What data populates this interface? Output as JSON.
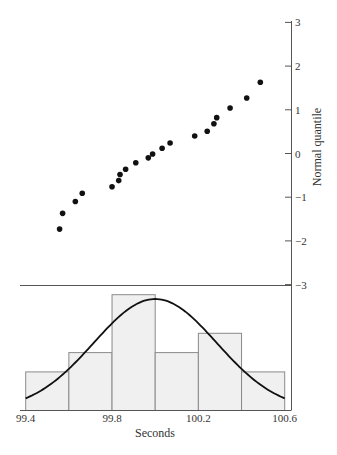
{
  "chart_data": [
    {
      "type": "scatter",
      "title": "",
      "subtitle": "Normal quantile plot",
      "xlabel": "Seconds",
      "ylabel": "Normal quantile",
      "xlim": [
        99.4,
        100.6
      ],
      "ylim": [
        -3,
        3
      ],
      "y_ticks": [
        3,
        2,
        1,
        0,
        -1,
        -2,
        -3
      ],
      "y_tick_labels": [
        "3",
        "2",
        "1",
        "0",
        "−1",
        "−2",
        "−3"
      ],
      "y_axis_position": "right",
      "grid": false,
      "points": [
        {
          "x": 99.557,
          "y": -1.73
        },
        {
          "x": 99.571,
          "y": -1.37
        },
        {
          "x": 99.63,
          "y": -1.1
        },
        {
          "x": 99.662,
          "y": -0.91
        },
        {
          "x": 99.8,
          "y": -0.76
        },
        {
          "x": 99.831,
          "y": -0.62
        },
        {
          "x": 99.837,
          "y": -0.48
        },
        {
          "x": 99.863,
          "y": -0.36
        },
        {
          "x": 99.91,
          "y": -0.21
        },
        {
          "x": 99.968,
          "y": -0.1
        },
        {
          "x": 99.988,
          "y": -0.01
        },
        {
          "x": 100.032,
          "y": 0.12
        },
        {
          "x": 100.069,
          "y": 0.24
        },
        {
          "x": 100.183,
          "y": 0.4
        },
        {
          "x": 100.241,
          "y": 0.51
        },
        {
          "x": 100.272,
          "y": 0.68
        },
        {
          "x": 100.285,
          "y": 0.82
        },
        {
          "x": 100.347,
          "y": 1.04
        },
        {
          "x": 100.424,
          "y": 1.27
        },
        {
          "x": 100.487,
          "y": 1.63
        }
      ]
    },
    {
      "type": "bar",
      "subtitle": "Histogram with fitted normal curve",
      "xlabel": "Seconds",
      "ylabel": "",
      "bin_edges": [
        99.4,
        99.6,
        99.8,
        100.0,
        100.2,
        100.4,
        100.6
      ],
      "categories": [
        "99.4-99.6",
        "99.6-99.8",
        "99.8-100.0",
        "100.0-100.2",
        "100.2-100.4",
        "100.4-100.6"
      ],
      "values": [
        2,
        3,
        6,
        3,
        4,
        2
      ],
      "x_ticks": [
        99.4,
        99.8,
        100.2,
        100.6
      ],
      "x_tick_labels": [
        "99.4",
        "99.8",
        "100.2",
        "100.6"
      ],
      "overlay_curve": {
        "type": "normal",
        "mean": 100.0,
        "sd": 0.285
      },
      "grid": false
    }
  ],
  "colors": {
    "points": "#111111",
    "bar_fill": "#f0f0f0",
    "bar_stroke": "#8a8a8a",
    "curve": "#111111",
    "axis": "#555555",
    "text": "#333333"
  },
  "labels": {
    "ylabel": "Normal quantile",
    "xlabel": "Seconds",
    "y_ticks": [
      "3",
      "2",
      "1",
      "0",
      "−1",
      "−2",
      "−3"
    ],
    "x_ticks": [
      "99.4",
      "99.8",
      "100.2",
      "100.6"
    ]
  }
}
